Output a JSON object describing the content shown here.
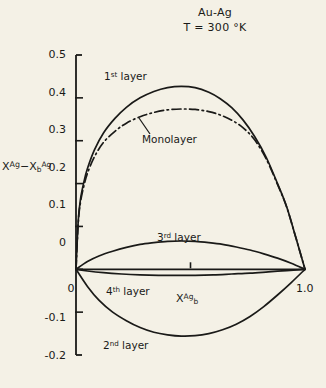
{
  "title": {
    "line1": "Au-Ag",
    "line2": "T = 300 °K"
  },
  "axes": {
    "ylabel_main": "X",
    "ylabel_sup1": "Ag",
    "ylabel_minus": "−X",
    "ylabel_sub": "b",
    "ylabel_sup2": "Ag",
    "xlabel_main": "X",
    "xlabel_sub": "b",
    "xlabel_sup": "Ag",
    "ytick_labels": [
      "0.5",
      "0.4",
      "0.3",
      "0.2",
      "0.1",
      "0",
      "-0.1",
      "-0.2"
    ],
    "ytick_values": [
      0.5,
      0.4,
      0.3,
      0.2,
      0.1,
      0,
      -0.1,
      -0.2
    ],
    "xtick_labels": [
      "0",
      "1.0"
    ],
    "xtick_values": [
      0,
      1.0
    ],
    "xtick_minor_values": [
      0.5
    ],
    "xlim": [
      0,
      1.0
    ],
    "ylim": [
      -0.2,
      0.5
    ],
    "line_color": "#1a1a18"
  },
  "curve_labels": {
    "first_layer_num": "1",
    "first_layer_sup": "st",
    "first_layer_word": "layer",
    "monolayer": "Monolayer",
    "third_layer_num": "3",
    "third_layer_sup": "rd",
    "third_layer_word": "layer",
    "fourth_layer_num": "4",
    "fourth_layer_sup": "th",
    "fourth_layer_word": "layer",
    "second_layer_num": "2",
    "second_layer_sup": "nd",
    "second_layer_word": "layer"
  },
  "chart_data": {
    "type": "line",
    "title": "Au-Ag  T = 300 °K",
    "xlabel": "X_b^Ag",
    "ylabel": "X^Ag - X_b^Ag",
    "xlim": [
      0,
      1.0
    ],
    "ylim": [
      -0.2,
      0.5
    ],
    "grid": false,
    "legend": "inline annotations",
    "series": [
      {
        "name": "1st layer",
        "style": "solid",
        "x": [
          0.0,
          0.01,
          0.02,
          0.035,
          0.05,
          0.08,
          0.12,
          0.17,
          0.22,
          0.28,
          0.34,
          0.4,
          0.46,
          0.52,
          0.58,
          0.63,
          0.68,
          0.73,
          0.78,
          0.83,
          0.88,
          0.92,
          0.96,
          1.0
        ],
        "y": [
          0.0,
          0.115,
          0.165,
          0.205,
          0.235,
          0.278,
          0.318,
          0.352,
          0.378,
          0.4,
          0.415,
          0.424,
          0.427,
          0.424,
          0.413,
          0.398,
          0.377,
          0.348,
          0.31,
          0.262,
          0.2,
          0.146,
          0.074,
          0.0
        ]
      },
      {
        "name": "Monolayer",
        "style": "dash-dot",
        "x": [
          0.0,
          0.01,
          0.02,
          0.035,
          0.05,
          0.08,
          0.12,
          0.17,
          0.22,
          0.28,
          0.34,
          0.4,
          0.46,
          0.52,
          0.58,
          0.63,
          0.68,
          0.73,
          0.78,
          0.83,
          0.88,
          0.92,
          0.96,
          1.0
        ],
        "y": [
          0.0,
          0.11,
          0.158,
          0.196,
          0.224,
          0.262,
          0.296,
          0.322,
          0.341,
          0.356,
          0.366,
          0.372,
          0.374,
          0.373,
          0.368,
          0.36,
          0.348,
          0.33,
          0.302,
          0.258,
          0.198,
          0.145,
          0.074,
          0.0
        ]
      },
      {
        "name": "2nd layer",
        "style": "solid",
        "x": [
          0.0,
          0.05,
          0.1,
          0.16,
          0.22,
          0.28,
          0.34,
          0.4,
          0.46,
          0.52,
          0.58,
          0.64,
          0.7,
          0.76,
          0.82,
          0.88,
          0.94,
          1.0
        ],
        "y": [
          0.0,
          -0.04,
          -0.072,
          -0.1,
          -0.12,
          -0.136,
          -0.147,
          -0.153,
          -0.156,
          -0.155,
          -0.15,
          -0.141,
          -0.128,
          -0.11,
          -0.087,
          -0.06,
          -0.031,
          0.0
        ]
      },
      {
        "name": "3rd layer",
        "style": "solid",
        "x": [
          0.0,
          0.05,
          0.1,
          0.16,
          0.22,
          0.28,
          0.34,
          0.4,
          0.46,
          0.52,
          0.58,
          0.64,
          0.7,
          0.76,
          0.82,
          0.88,
          0.94,
          1.0
        ],
        "y": [
          0.0,
          0.018,
          0.031,
          0.042,
          0.051,
          0.058,
          0.062,
          0.065,
          0.066,
          0.065,
          0.062,
          0.058,
          0.052,
          0.045,
          0.036,
          0.026,
          0.014,
          0.0
        ]
      },
      {
        "name": "4th layer",
        "style": "solid",
        "x": [
          0.0,
          0.05,
          0.12,
          0.2,
          0.28,
          0.36,
          0.44,
          0.52,
          0.6,
          0.68,
          0.76,
          0.84,
          0.92,
          1.0
        ],
        "y": [
          0.0,
          -0.004,
          -0.008,
          -0.011,
          -0.013,
          -0.014,
          -0.014,
          -0.014,
          -0.013,
          -0.011,
          -0.009,
          -0.006,
          -0.003,
          0.0
        ]
      }
    ]
  }
}
